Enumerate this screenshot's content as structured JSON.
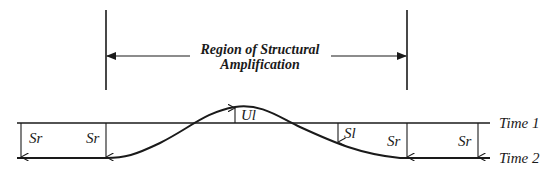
{
  "diagram": {
    "region_label_line1": "Region of Structural",
    "region_label_line2": "Amplification",
    "time1_label": "Time 1",
    "time2_label": "Time 2",
    "settlement_labels": {
      "sr_far_left": "Sr",
      "sr_left": "Sr",
      "ul": "Ul",
      "sl": "Sl",
      "sr_right": "Sr",
      "sr_far_right": "Sr"
    }
  }
}
